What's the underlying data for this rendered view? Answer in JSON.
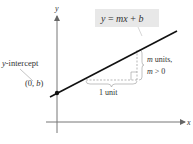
{
  "diagram": {
    "equation_label": "y = mx + b",
    "equation_parts": {
      "y": "y",
      "eq": " = ",
      "mx": "mx",
      "plus": " + ",
      "b": "b"
    },
    "y_axis_label": "y",
    "x_axis_label": "x",
    "intercept_label": "y-intercept",
    "intercept_point": {
      "open": "(0, ",
      "b": "b",
      "close": ")"
    },
    "run_label": "1 unit",
    "rise_label_line1_var": "m",
    "rise_label_line1_text": " units,",
    "rise_label_line2": "m > 0",
    "rise_label_line2_var": "m",
    "rise_label_line2_text": " > 0",
    "colors": {
      "line": "#111111",
      "axis": "#777777",
      "dashed": "#999999",
      "label_box": "#e8e8e8",
      "text": "#333333"
    }
  }
}
